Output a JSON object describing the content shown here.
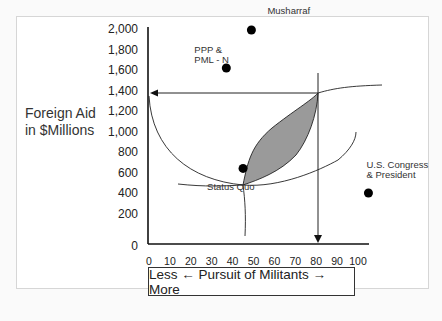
{
  "chart_data": {
    "type": "scatter",
    "title": "",
    "ylabel": "Foreign Aid in $Millions",
    "ylabel_lines": [
      "Foreign Aid",
      "in $Millions"
    ],
    "xlabel": "Less ← Pursuit of Militants → More",
    "xlim": [
      0,
      105
    ],
    "ylim": [
      0,
      2000
    ],
    "y_ticks": [
      0,
      200,
      400,
      600,
      800,
      1000,
      1200,
      1400,
      1600,
      1800,
      2000
    ],
    "y_tick_labels": [
      "0",
      "200",
      "400",
      "600",
      "800",
      "1,000",
      "1,200",
      "1,400",
      "1,600",
      "1,800",
      "2,000"
    ],
    "x_ticks": [
      0,
      10,
      20,
      30,
      40,
      50,
      60,
      70,
      80,
      90,
      100
    ],
    "x_tick_labels": [
      "0",
      "10",
      "20",
      "30",
      "40",
      "50",
      "60",
      "70",
      "80",
      "90",
      "100"
    ],
    "grid": false,
    "points": [
      {
        "name": "Musharraf",
        "label_lines": [
          "Musharraf"
        ],
        "x": 49,
        "y": 1990
      },
      {
        "name": "PPP & PML-N",
        "label_lines": [
          "PPP &",
          "PML - N"
        ],
        "x": 37,
        "y": 1620
      },
      {
        "name": "Status Quo",
        "label_lines": [
          "Status Quo"
        ],
        "x": 45,
        "y": 640
      },
      {
        "name": "U.S. Congress & President",
        "label_lines": [
          "U.S. Congress",
          "& President"
        ],
        "x": 105,
        "y": 400
      }
    ],
    "outcome": {
      "x": 82,
      "y": 1500
    },
    "annotations": [
      "Arrow from outcome point to y-axis at 1,500",
      "Arrow from outcome point down to x-axis at 82",
      "Shaded win-set lens between Status Quo and outcome"
    ]
  }
}
